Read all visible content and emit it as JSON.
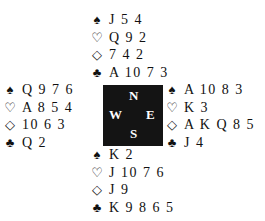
{
  "suits": {
    "spades": "♠",
    "hearts": "♡",
    "diamonds": "◇",
    "clubs": "♣"
  },
  "compass": {
    "north": "N",
    "west": "W",
    "east": "E",
    "south": "S"
  },
  "hands": {
    "north": {
      "spades": "J 5 4",
      "hearts": "Q 9 2",
      "diamonds": "7 4 2",
      "clubs": "A 10 7 3"
    },
    "west": {
      "spades": "Q 9 7 6",
      "hearts": "A 8 5 4",
      "diamonds": "10 6 3",
      "clubs": "Q 2"
    },
    "east": {
      "spades": "A 10 8 3",
      "hearts": "K 3",
      "diamonds": "A K Q 8 5",
      "clubs": "J 4"
    },
    "south": {
      "spades": "K 2",
      "hearts": "J 10 7 6",
      "diamonds": "J 9",
      "clubs": "K 9 8 6 5"
    }
  }
}
